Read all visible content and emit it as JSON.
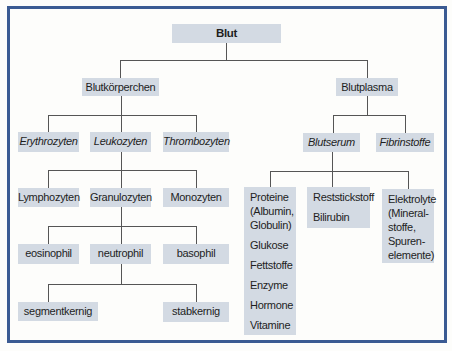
{
  "diagram": {
    "title": "Blut",
    "level1": {
      "left": "Blutkörperchen",
      "right": "Blutplasma"
    },
    "blutkoerperchen_children": [
      "Erythrozyten",
      "Leukozyten",
      "Thrombozyten"
    ],
    "leukozyten_children": [
      "Lymphozyten",
      "Granulozyten",
      "Monozyten"
    ],
    "granulozyten_children": [
      "eosinophil",
      "neutrophil",
      "basophil"
    ],
    "neutrophil_children": [
      "segmentkernig",
      "stabkernig"
    ],
    "blutplasma_children": [
      "Blutserum",
      "Fibrinstoffe"
    ],
    "blutserum_children": {
      "proteine": [
        "Proteine (Albumin, Globulin)",
        "Glukose",
        "Fettstoffe",
        "Enzyme",
        "Hormone",
        "Vitamine"
      ],
      "reststickstoff": [
        "Reststickstoff",
        "Bilirubin"
      ],
      "elektrolyte": [
        "Elektrolyte (Mineral-stoffe, Spuren-elemente)"
      ]
    },
    "colors": {
      "frame_border": "#3b5b93",
      "box_fill": "#d3dae3",
      "connector": "#555555"
    }
  }
}
